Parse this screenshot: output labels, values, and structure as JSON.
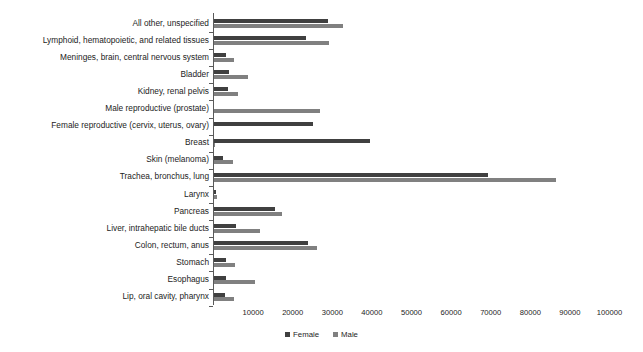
{
  "chart_data": {
    "type": "bar",
    "orientation": "horizontal",
    "title": "",
    "xlabel": "",
    "ylabel": "",
    "xlim": [
      0,
      100000
    ],
    "grid": false,
    "legend_position": "bottom",
    "xticks": [
      10000,
      20000,
      30000,
      40000,
      50000,
      60000,
      70000,
      80000,
      90000,
      100000
    ],
    "xtick_labels": [
      "10000",
      "20000",
      "30000",
      "40000",
      "50000",
      "60000",
      "70000",
      "80000",
      "90000",
      "100000"
    ],
    "categories": [
      "All other, unspecified",
      "Lymphoid, hematopoietic, and related tissues",
      "Meninges, brain, central nervous system",
      "Bladder",
      "Kidney, renal pelvis",
      "Male reproductive (prostate)",
      "Female reproductive (cervix, uterus, ovary)",
      "Breast",
      "Skin (melanoma)",
      "Trachea, bronchus, lung",
      "Larynx",
      "Pancreas",
      "Liver, intrahepatic bile ducts",
      "Colon, rectum, anus",
      "Stomach",
      "Esophagus",
      "Lip, oral cavity, pharynx"
    ],
    "series": [
      {
        "name": "Female",
        "color": "#404040",
        "values": [
          28800,
          23300,
          3100,
          4000,
          3600,
          0,
          25100,
          39500,
          2300,
          69300,
          600,
          15500,
          5600,
          23900,
          3200,
          3100,
          2900
        ]
      },
      {
        "name": "Male",
        "color": "#808080",
        "values": [
          32700,
          29200,
          5100,
          8600,
          6300,
          26900,
          0,
          400,
          5000,
          86600,
          1000,
          17200,
          11800,
          26100,
          5400,
          10400,
          5300
        ]
      }
    ]
  },
  "legend": {
    "items": [
      {
        "label": "Female",
        "color": "#404040"
      },
      {
        "label": "Male",
        "color": "#808080"
      }
    ]
  }
}
